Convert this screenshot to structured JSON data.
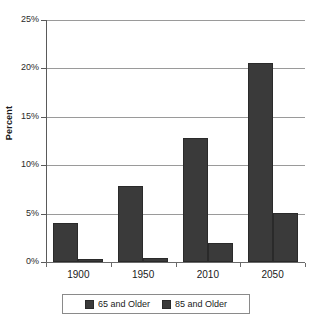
{
  "chart_data": {
    "type": "bar",
    "title": "",
    "subtitle": "",
    "xlabel": "",
    "ylabel": "Percent",
    "categories": [
      "1900",
      "1950",
      "2010",
      "2050"
    ],
    "series": [
      {
        "name": "65 and Older",
        "values": [
          4.0,
          7.9,
          12.8,
          20.6
        ]
      },
      {
        "name": "85 and Older",
        "values": [
          0.3,
          0.4,
          2.0,
          5.1
        ]
      }
    ],
    "ylim": [
      0,
      25
    ],
    "ytick_values": [
      0,
      5,
      10,
      15,
      20,
      25
    ],
    "ytick_labels": [
      "0%",
      "5%",
      "10%",
      "15%",
      "20%",
      "25%"
    ],
    "grid": "horizontal",
    "legend_position": "bottom",
    "bar_color": "#3a3a3a",
    "gridline_color": "#9a9a9a",
    "axis_color": "#6a6a6a",
    "background": "#ffffff"
  }
}
